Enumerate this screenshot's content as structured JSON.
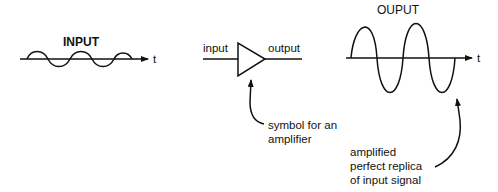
{
  "input_panel": {
    "title": "INPUT",
    "axis_label": "t"
  },
  "amplifier_panel": {
    "input_label": "input",
    "output_label": "output",
    "annotation": [
      "symbol for an",
      "amplifier"
    ]
  },
  "output_panel": {
    "title": "OUPUT",
    "axis_label": "t",
    "annotation": [
      "amplified",
      "perfect replica",
      "of input signal"
    ]
  },
  "colors": {
    "ink": "#111111",
    "background": "#ffffff"
  }
}
